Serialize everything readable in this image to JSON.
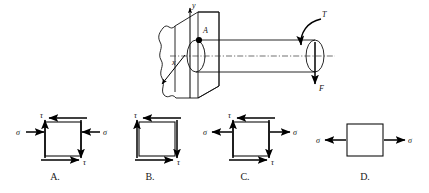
{
  "figure": {
    "background_color": "#ffffff",
    "line_color": "#111111"
  },
  "main_diagram": {
    "name": "cantilever-shaft-with-torque-and-force",
    "description": "Circular shaft built into a wall, loaded at the free end by a torque and a transverse downward force",
    "point_label": "A",
    "axis_label_vertical": "y",
    "axis_label_diagonal": "x",
    "torque_label": "T",
    "force_label": "F"
  },
  "options": [
    {
      "key": "A",
      "label": "A.",
      "normal_stress_label": "σ",
      "shear_stress_label": "τ",
      "normal_stress_sense": "compression",
      "has_normal_stress": true,
      "has_shear_stress": true,
      "sigma_left_label": "σ",
      "sigma_right_label": "σ",
      "tau_top_label": "τ",
      "tau_bottom_label": "τ"
    },
    {
      "key": "B",
      "label": "B.",
      "normal_stress_label": "",
      "shear_stress_label": "τ",
      "normal_stress_sense": "none",
      "has_normal_stress": false,
      "has_shear_stress": true,
      "sigma_left_label": "",
      "sigma_right_label": "",
      "tau_top_label": "τ",
      "tau_bottom_label": "τ"
    },
    {
      "key": "C",
      "label": "C.",
      "normal_stress_label": "σ",
      "shear_stress_label": "τ",
      "normal_stress_sense": "tension",
      "has_normal_stress": true,
      "has_shear_stress": true,
      "sigma_left_label": "σ",
      "sigma_right_label": "σ",
      "tau_top_label": "τ",
      "tau_bottom_label": "τ"
    },
    {
      "key": "D",
      "label": "D.",
      "normal_stress_label": "σ",
      "shear_stress_label": "",
      "normal_stress_sense": "tension",
      "has_normal_stress": true,
      "has_shear_stress": false,
      "sigma_left_label": "σ",
      "sigma_right_label": "σ",
      "tau_top_label": "",
      "tau_bottom_label": ""
    }
  ]
}
